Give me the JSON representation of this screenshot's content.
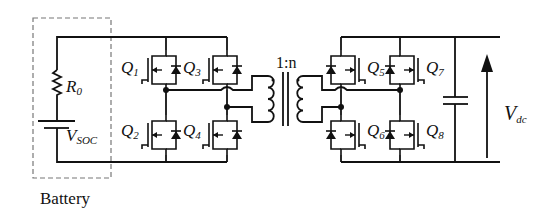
{
  "diagram": {
    "battery": {
      "box_label": "Battery",
      "resistor": {
        "symbol": "R",
        "subscript": "0"
      },
      "source": {
        "symbol": "V",
        "subscript": "SOC"
      }
    },
    "primary_bridge": {
      "switches": [
        {
          "symbol": "Q",
          "subscript": "1",
          "position": "top-left"
        },
        {
          "symbol": "Q",
          "subscript": "2",
          "position": "bottom-left"
        },
        {
          "symbol": "Q",
          "subscript": "3",
          "position": "top-right"
        },
        {
          "symbol": "Q",
          "subscript": "4",
          "position": "bottom-right"
        }
      ]
    },
    "transformer": {
      "ratio_label": "1:n"
    },
    "secondary_bridge": {
      "switches": [
        {
          "symbol": "Q",
          "subscript": "5",
          "position": "top-left"
        },
        {
          "symbol": "Q",
          "subscript": "6",
          "position": "bottom-left"
        },
        {
          "symbol": "Q",
          "subscript": "7",
          "position": "top-right"
        },
        {
          "symbol": "Q",
          "subscript": "8",
          "position": "bottom-right"
        }
      ]
    },
    "output": {
      "voltage": {
        "symbol": "V",
        "subscript": "dc"
      }
    },
    "colors": {
      "stroke": "#111111",
      "dashed_box": "#777777",
      "background": "#ffffff"
    }
  }
}
